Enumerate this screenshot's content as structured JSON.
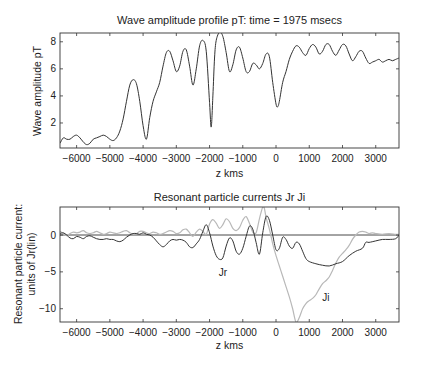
{
  "chart_data": [
    {
      "type": "line",
      "title": "Wave amplitude profile pT: time = 1975 msecs",
      "xlabel": "z kms",
      "ylabel": "Wave amplitude pT",
      "xlim": [
        -6500,
        3700
      ],
      "ylim": [
        0.15,
        8.65
      ],
      "xticks": [
        -6000,
        -5000,
        -4000,
        -3000,
        -2000,
        -1000,
        0,
        1000,
        2000,
        3000
      ],
      "xtick_labels": [
        "−6000",
        "−5000",
        "−4000",
        "−3000",
        "−2000",
        "−1000",
        "0",
        "1000",
        "2000",
        "3000"
      ],
      "yticks": [
        2,
        4,
        6,
        8
      ],
      "ytick_labels": [
        "2",
        "4",
        "6",
        "8"
      ],
      "grid": false,
      "series": [
        {
          "name": "Wave amplitude",
          "color": "#333333",
          "x": [
            -6500,
            -6400,
            -6300,
            -6200,
            -6100,
            -6000,
            -5900,
            -5800,
            -5700,
            -5600,
            -5500,
            -5400,
            -5300,
            -5200,
            -5100,
            -5000,
            -4900,
            -4800,
            -4700,
            -4600,
            -4500,
            -4400,
            -4300,
            -4200,
            -4100,
            -4000,
            -3900,
            -3800,
            -3700,
            -3600,
            -3500,
            -3400,
            -3300,
            -3200,
            -3100,
            -3000,
            -2900,
            -2800,
            -2700,
            -2600,
            -2500,
            -2400,
            -2300,
            -2200,
            -2100,
            -2000,
            -1950,
            -1900,
            -1850,
            -1800,
            -1700,
            -1600,
            -1500,
            -1400,
            -1300,
            -1200,
            -1100,
            -1000,
            -900,
            -800,
            -700,
            -600,
            -500,
            -400,
            -300,
            -200,
            -100,
            0,
            50,
            100,
            200,
            300,
            400,
            500,
            600,
            700,
            800,
            900,
            1000,
            1100,
            1200,
            1300,
            1400,
            1500,
            1600,
            1700,
            1800,
            1900,
            2000,
            2100,
            2200,
            2300,
            2400,
            2500,
            2600,
            2700,
            2800,
            2900,
            3000,
            3100,
            3200,
            3300,
            3400,
            3500,
            3600,
            3700
          ],
          "y": [
            0.5,
            0.9,
            0.8,
            0.8,
            1.0,
            1.1,
            0.9,
            0.6,
            0.4,
            0.5,
            0.8,
            0.9,
            1.0,
            1.1,
            1.0,
            0.8,
            0.7,
            0.9,
            1.4,
            2.3,
            3.6,
            4.8,
            5.2,
            4.9,
            3.6,
            1.8,
            0.8,
            2.4,
            3.6,
            4.3,
            5.0,
            6.2,
            7.2,
            7.3,
            6.6,
            5.8,
            6.2,
            7.3,
            7.4,
            6.2,
            4.8,
            6.0,
            7.7,
            8.1,
            7.3,
            3.5,
            1.7,
            4.0,
            6.8,
            8.1,
            8.7,
            8.4,
            7.2,
            5.8,
            6.3,
            7.4,
            7.6,
            6.8,
            5.8,
            5.8,
            6.4,
            6.3,
            6.0,
            6.4,
            7.1,
            6.9,
            5.0,
            3.4,
            3.2,
            3.6,
            5.0,
            5.8,
            6.7,
            7.3,
            7.7,
            7.6,
            7.2,
            7.0,
            7.5,
            7.8,
            7.6,
            7.1,
            7.3,
            7.8,
            7.8,
            7.3,
            7.0,
            7.4,
            7.8,
            7.7,
            7.1,
            6.6,
            6.9,
            7.3,
            7.3,
            6.8,
            6.4,
            6.5,
            6.6,
            6.7,
            6.5,
            6.6,
            6.7,
            6.6,
            6.7,
            6.8
          ]
        }
      ]
    },
    {
      "type": "line",
      "title": "Resonant particle currents Jr Ji",
      "xlabel": "z kms",
      "ylabel": "Resonant particle current: units of Jr(lin)",
      "ylabel_lines": [
        "Resonant particle current:",
        "units of Jr(lin)"
      ],
      "xlim": [
        -6500,
        3700
      ],
      "ylim": [
        -11.8,
        3.8
      ],
      "xticks": [
        -6000,
        -5000,
        -4000,
        -3000,
        -2000,
        -1000,
        0,
        1000,
        2000,
        3000
      ],
      "xtick_labels": [
        "−6000",
        "−5000",
        "−4000",
        "−3000",
        "−2000",
        "−1000",
        "0",
        "1000",
        "2000",
        "3000"
      ],
      "yticks": [
        0,
        -5,
        -10
      ],
      "ytick_labels": [
        "0",
        "−5",
        "−10"
      ],
      "grid": false,
      "reference_line": 0,
      "annotations": [
        {
          "text": "Jr",
          "x": -1600,
          "y": -5.5
        },
        {
          "text": "Ji",
          "x": 1500,
          "y": -9.0
        }
      ],
      "series": [
        {
          "name": "Jr",
          "color": "#333333",
          "x": [
            -6500,
            -6400,
            -6300,
            -6200,
            -6100,
            -6000,
            -5900,
            -5800,
            -5700,
            -5600,
            -5500,
            -5400,
            -5300,
            -5200,
            -5100,
            -5000,
            -4900,
            -4800,
            -4700,
            -4600,
            -4500,
            -4400,
            -4300,
            -4200,
            -4100,
            -4000,
            -3900,
            -3800,
            -3700,
            -3600,
            -3500,
            -3400,
            -3300,
            -3200,
            -3100,
            -3000,
            -2900,
            -2800,
            -2700,
            -2600,
            -2500,
            -2400,
            -2300,
            -2200,
            -2100,
            -2000,
            -1900,
            -1800,
            -1700,
            -1600,
            -1500,
            -1400,
            -1300,
            -1200,
            -1100,
            -1000,
            -900,
            -800,
            -700,
            -600,
            -500,
            -400,
            -300,
            -200,
            -100,
            0,
            100,
            200,
            300,
            400,
            500,
            600,
            700,
            800,
            900,
            1000,
            1200,
            1400,
            1600,
            1800,
            2000,
            2200,
            2400,
            2600,
            2700,
            2800,
            3000,
            3200,
            3400,
            3600,
            3700
          ],
          "y": [
            0.2,
            0.3,
            0.0,
            -0.4,
            -0.5,
            -0.2,
            -0.3,
            -0.5,
            -0.2,
            -0.1,
            -0.3,
            -0.5,
            -0.6,
            -0.6,
            -0.5,
            -0.6,
            -0.6,
            -0.8,
            -0.9,
            -0.7,
            -0.3,
            0.0,
            0.2,
            0.2,
            0.1,
            0.3,
            0.1,
            0.0,
            -0.3,
            -0.8,
            -1.3,
            -1.6,
            -1.3,
            -0.8,
            -0.6,
            -0.7,
            -0.6,
            -0.7,
            -1.0,
            -1.6,
            -1.7,
            -1.2,
            -0.6,
            0.5,
            1.4,
            0.3,
            -1.5,
            -2.8,
            -3.3,
            -3.1,
            -1.5,
            -0.4,
            -0.8,
            -2.2,
            -2.6,
            -1.8,
            -0.2,
            1.2,
            0.8,
            -1.0,
            -2.6,
            0.3,
            2.5,
            2.0,
            0.0,
            -2.0,
            -1.8,
            -0.3,
            -0.6,
            -1.5,
            -1.8,
            -1.0,
            -1.2,
            -2.2,
            -3.2,
            -3.6,
            -3.9,
            -4.1,
            -4.2,
            -3.9,
            -3.6,
            -2.8,
            -2.2,
            -1.8,
            -1.0,
            -1.0,
            -0.8,
            -0.6,
            -0.6,
            -0.5,
            0.0
          ]
        },
        {
          "name": "Ji",
          "color": "#b8b8b8",
          "x": [
            -6500,
            -6400,
            -6300,
            -6200,
            -6100,
            -6000,
            -5900,
            -5800,
            -5700,
            -5600,
            -5500,
            -5400,
            -5300,
            -5200,
            -5100,
            -5000,
            -4900,
            -4800,
            -4700,
            -4600,
            -4500,
            -4400,
            -4300,
            -4200,
            -4100,
            -4000,
            -3900,
            -3800,
            -3700,
            -3600,
            -3500,
            -3400,
            -3300,
            -3200,
            -3100,
            -3000,
            -2900,
            -2800,
            -2700,
            -2600,
            -2500,
            -2400,
            -2300,
            -2200,
            -2100,
            -2000,
            -1900,
            -1800,
            -1700,
            -1600,
            -1500,
            -1400,
            -1300,
            -1200,
            -1100,
            -1000,
            -900,
            -800,
            -700,
            -600,
            -500,
            -400,
            -350,
            -300,
            -200,
            -100,
            0,
            100,
            200,
            300,
            400,
            500,
            600,
            700,
            800,
            900,
            1000,
            1100,
            1200,
            1300,
            1400,
            1500,
            1600,
            1700,
            1800,
            1900,
            2000,
            2100,
            2200,
            2300,
            2400,
            2500,
            2600,
            2700,
            2800,
            2900,
            3000,
            3200,
            3400,
            3600,
            3700
          ],
          "y": [
            0.5,
            0.2,
            -0.1,
            0.2,
            0.4,
            0.3,
            0.4,
            0.6,
            0.3,
            0.2,
            0.3,
            0.5,
            0.3,
            0.1,
            0.2,
            0.4,
            0.3,
            0.2,
            0.3,
            0.5,
            0.6,
            0.3,
            0.1,
            0.2,
            0.5,
            0.5,
            0.3,
            0.2,
            0.4,
            0.3,
            0.1,
            0.2,
            0.4,
            0.6,
            0.5,
            0.2,
            0.3,
            0.7,
            0.8,
            0.3,
            -0.2,
            0.4,
            0.8,
            0.5,
            0.1,
            1.5,
            2.1,
            1.6,
            0.9,
            1.4,
            2.2,
            1.8,
            0.9,
            0.6,
            1.0,
            2.0,
            2.5,
            1.6,
            0.4,
            0.3,
            2.2,
            3.8,
            3.6,
            2.4,
            0.8,
            -1.2,
            -2.8,
            -4.2,
            -5.6,
            -7.0,
            -8.4,
            -10.0,
            -11.8,
            -11.2,
            -10.0,
            -9.3,
            -8.9,
            -8.6,
            -8.1,
            -7.3,
            -6.6,
            -6.2,
            -5.7,
            -4.8,
            -3.8,
            -3.0,
            -2.5,
            -2.0,
            -1.4,
            -0.6,
            0.0,
            0.4,
            0.5,
            0.4,
            0.2,
            0.3,
            0.2,
            0.1,
            0.2,
            0.1,
            0.1
          ]
        }
      ]
    }
  ]
}
